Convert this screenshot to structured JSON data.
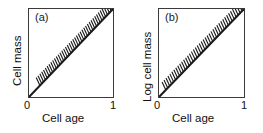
{
  "figure": {
    "background_color": "#ffffff",
    "line_color": "#1a1a1a",
    "frame_color": "#3a3a3a"
  },
  "panels": [
    {
      "label": "(a)",
      "name": "panel-a",
      "xlabel": "Cell age",
      "ylabel": "Cell mass",
      "xticks": [
        "0",
        "1"
      ],
      "xtick_zero": "0",
      "xtick_one": "1"
    },
    {
      "label": "(b)",
      "name": "panel-b",
      "xlabel": "Cell age",
      "ylabel": "Log cell mass",
      "xticks": [
        "0",
        "1"
      ],
      "xtick_zero": "0",
      "xtick_one": "1"
    }
  ],
  "chart_data": [
    {
      "type": "line",
      "title": "(a)",
      "xlabel": "Cell age",
      "ylabel": "Cell mass",
      "xlim": [
        0,
        1
      ],
      "ylim": [
        0,
        1
      ],
      "xticks": [
        0,
        1
      ],
      "xticklabels": [
        "0",
        "1"
      ],
      "yticks": [],
      "yticklabels": [],
      "grid": false,
      "legend": false,
      "series": [
        {
          "name": "cell mass vs cell age",
          "style": "solid-line-with-upper-hatching",
          "x": [
            0,
            0.1,
            0.2,
            0.3,
            0.4,
            0.5,
            0.6,
            0.7,
            0.8,
            0.9,
            1.0
          ],
          "values": [
            0,
            0.1,
            0.2,
            0.3,
            0.4,
            0.5,
            0.6,
            0.7,
            0.8,
            0.9,
            1.0
          ]
        }
      ],
      "annotation": "Hatch marks drawn on the upper-left side of the diagonal line indicate the boundary/constraint region.",
      "hatch": {
        "side": "upper-left",
        "count": 40,
        "start_fraction": 0.13,
        "end_fraction": 1.0,
        "tick_length_px": 9,
        "tick_angle_deg": 65
      }
    },
    {
      "type": "line",
      "title": "(b)",
      "xlabel": "Cell age",
      "ylabel": "Log cell mass",
      "xlim": [
        0,
        1
      ],
      "ylim": [
        0,
        1
      ],
      "xticks": [
        0,
        1
      ],
      "xticklabels": [
        "0",
        "1"
      ],
      "yticks": [],
      "yticklabels": [],
      "grid": false,
      "legend": false,
      "series": [
        {
          "name": "log cell mass vs cell age",
          "style": "solid-line-with-upper-hatching",
          "x": [
            0,
            0.1,
            0.2,
            0.3,
            0.4,
            0.5,
            0.6,
            0.7,
            0.8,
            0.9,
            1.0
          ],
          "values": [
            0,
            0.1,
            0.2,
            0.3,
            0.4,
            0.5,
            0.6,
            0.7,
            0.8,
            0.9,
            1.0
          ]
        }
      ],
      "annotation": "Hatch marks drawn on the upper-left side of the diagonal line indicate the boundary/constraint region.",
      "hatch": {
        "side": "upper-left",
        "count": 40,
        "start_fraction": 0.08,
        "end_fraction": 1.0,
        "tick_length_px": 9,
        "tick_angle_deg": 65
      }
    }
  ]
}
